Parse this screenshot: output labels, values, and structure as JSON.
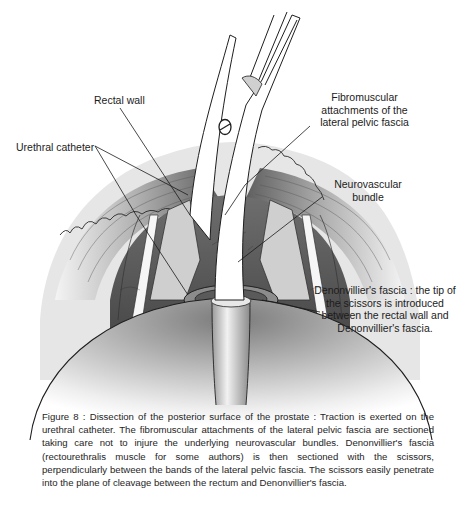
{
  "figure": {
    "number": "Figure 8",
    "labels": {
      "rectal_wall": "Rectal wall",
      "urethral_catheter": "Urethral catheter",
      "fibromuscular": [
        "Fibromuscular",
        "attachments of the",
        "lateral pelvic fascia"
      ],
      "neurovascular": [
        "Neurovascular",
        "bundle"
      ],
      "denonvillier": [
        "Denonvillier's fascia : the tip of",
        "the scissors is introduced",
        "between the rectal wall and",
        "Denonvillier's fascia."
      ]
    },
    "caption": "Figure 8 : Dissection of the posterior surface of the prostate : Traction is exerted on the urethral catheter. The fibromuscular attachments of the lateral pelvic fascia are sectioned taking care not to injure the underlying neurovascular bundles. Denonvillier's fascia (rectourethralis muscle for some authors) is then sectioned with the scissors, perpendicularly between the bands of the lateral pelvic fascia. The scissors easily penetrate into the plane of cleavage between the rectum and Denonvillier's fascia.",
    "colors": {
      "ink": "#1c1c1c",
      "tissue_dark": "#5a5a5a",
      "tissue_mid": "#9a9a9a",
      "tissue_light": "#d8d8d8"
    }
  }
}
